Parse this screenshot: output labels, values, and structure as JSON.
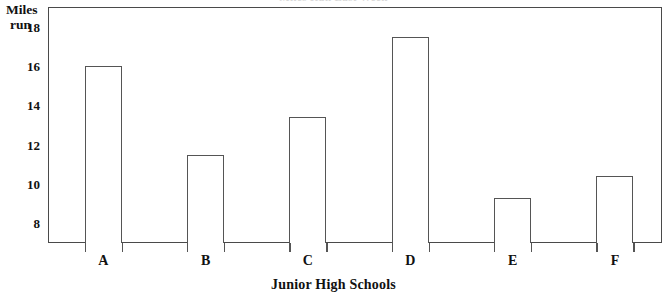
{
  "chart_data": {
    "type": "bar",
    "title": "Miles Run Last Week",
    "xlabel": "Junior High Schools",
    "ylabel": "Miles run",
    "categories": [
      "A",
      "B",
      "C",
      "D",
      "E",
      "F"
    ],
    "values": [
      16.0,
      11.5,
      13.4,
      17.5,
      9.3,
      10.4
    ],
    "ylim": [
      7.0,
      19.0
    ],
    "yticks": [
      8,
      10,
      12,
      14,
      16,
      18
    ],
    "ytick_labels": [
      "8",
      "10",
      "12",
      "14",
      "16",
      "18"
    ],
    "grid": false,
    "legend": "none",
    "bar_fill": "#ffffff",
    "bar_edge": "#555555",
    "frame_color": "#4a4a4a",
    "background": "#ffffff"
  },
  "axis": {
    "y_caption_line1": "Miles",
    "y_caption_line2": "run"
  }
}
